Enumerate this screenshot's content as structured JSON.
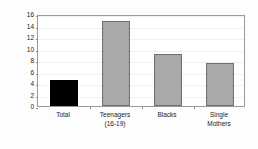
{
  "chart_data": {
    "type": "bar",
    "title": "",
    "subtitle": "",
    "xlabel": "",
    "ylabel": "Percent",
    "ylim": [
      0,
      16
    ],
    "ytick_step": 2,
    "yticks": [
      0,
      2,
      4,
      6,
      8,
      10,
      12,
      14,
      16
    ],
    "ytick_labels": [
      "0",
      "2",
      "4",
      "6",
      "8",
      "10",
      "12",
      "14",
      "16"
    ],
    "grid": true,
    "legend": "none",
    "categories": [
      {
        "line1": "Total",
        "line2": ""
      },
      {
        "line1": "Teenagers",
        "line2": "(16-19)"
      },
      {
        "line1": "Blacks",
        "line2": ""
      },
      {
        "line1": "Single",
        "line2": "Mothers"
      }
    ],
    "values": [
      4.5,
      14.8,
      9.0,
      7.4
    ],
    "bar_colors": [
      "#000000",
      "#a9a9a9",
      "#a9a9a9",
      "#a9a9a9"
    ],
    "bar_edge_colors": [
      "#000000",
      "#6f6f6f",
      "#6f6f6f",
      "#6f6f6f"
    ],
    "annotations": []
  },
  "style": {
    "plot_background": "#ffffff",
    "frame_color": "#9a9a9a",
    "gridline_color": "#f0f0f0",
    "text_color": "#1a1a1a"
  }
}
